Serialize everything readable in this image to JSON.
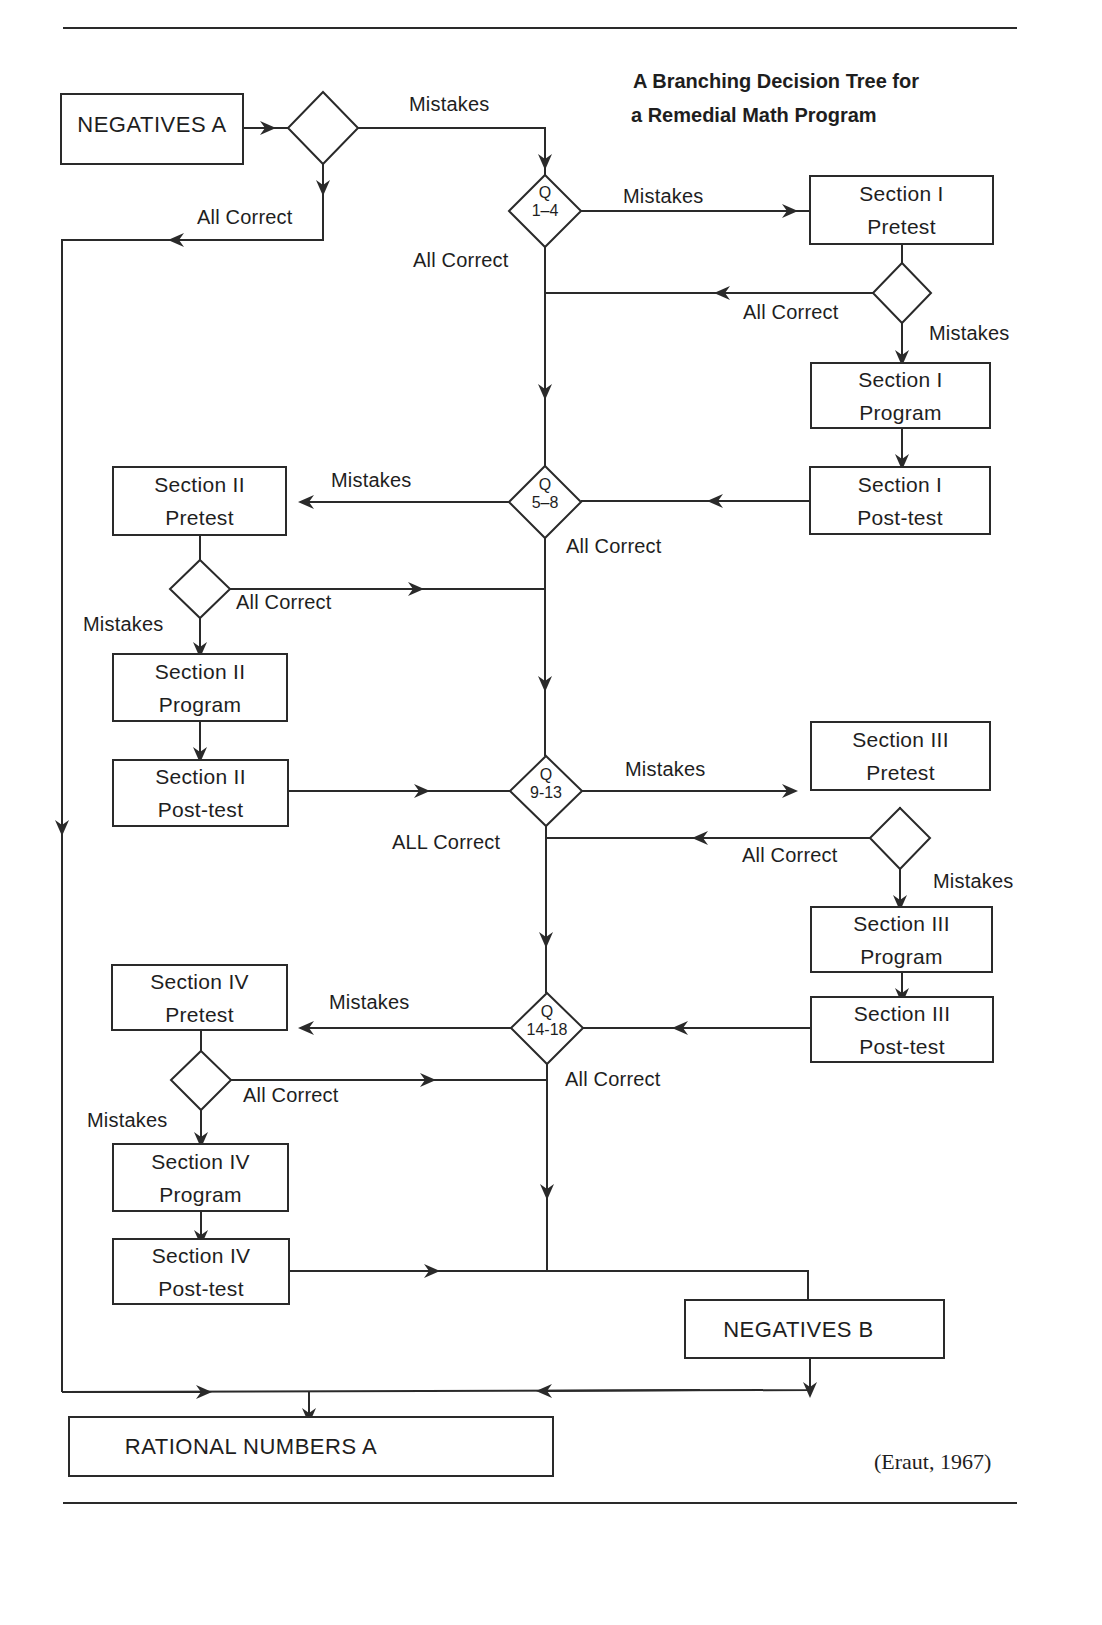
{
  "title": {
    "line1": "A Branching Decision Tree for",
    "line2": "a Remedial Math Program"
  },
  "citation": "(Eraut, 1967)",
  "colors": {
    "ink": "#2a2a2a",
    "background": "#ffffff"
  },
  "boxes": {
    "negatives_a": {
      "l1": "NEGATIVES A",
      "l2": ""
    },
    "s1_pretest": {
      "l1": "Section I",
      "l2": "Pretest"
    },
    "s1_program": {
      "l1": "Section I",
      "l2": "Program"
    },
    "s1_posttest": {
      "l1": "Section I",
      "l2": "Post-test"
    },
    "s2_pretest": {
      "l1": "Section II",
      "l2": "Pretest"
    },
    "s2_program": {
      "l1": "Section II",
      "l2": "Program"
    },
    "s2_posttest": {
      "l1": "Section II",
      "l2": "Post-test"
    },
    "s3_pretest": {
      "l1": "Section III",
      "l2": "Pretest"
    },
    "s3_program": {
      "l1": "Section III",
      "l2": "Program"
    },
    "s3_posttest": {
      "l1": "Section III",
      "l2": "Post-test"
    },
    "s4_pretest": {
      "l1": "Section IV",
      "l2": "Pretest"
    },
    "s4_program": {
      "l1": "Section IV",
      "l2": "Program"
    },
    "s4_posttest": {
      "l1": "Section IV",
      "l2": "Post-test"
    },
    "negatives_b": {
      "l1": "NEGATIVES B",
      "l2": ""
    },
    "rational_a": {
      "l1": "RATIONAL NUMBERS A",
      "l2": ""
    }
  },
  "decisions": {
    "q1_4": {
      "q": "Q",
      "range": "1–4"
    },
    "q5_8": {
      "q": "Q",
      "range": "5–8"
    },
    "q9_13": {
      "q": "Q",
      "range": "9-13"
    },
    "q14_18": {
      "q": "Q",
      "range": "14-18"
    }
  },
  "labels": {
    "neg_a_mistakes": "Mistakes",
    "neg_a_all_correct": "All Correct",
    "q1_all_correct": "All Correct",
    "q1_mistakes": "Mistakes",
    "s1_all_correct": "All Correct",
    "s1_mistakes": "Mistakes",
    "q5_mistakes": "Mistakes",
    "q5_all_correct": "All Correct",
    "s2_all_correct": "All Correct",
    "s2_mistakes": "Mistakes",
    "q9_mistakes": "Mistakes",
    "q9_all_correct": "ALL Correct",
    "s3_all_correct": "All Correct",
    "s3_mistakes": "Mistakes",
    "q14_mistakes": "Mistakes",
    "q14_all_correct": "All Correct",
    "s4_all_correct": "All Correct",
    "s4_mistakes": "Mistakes"
  }
}
